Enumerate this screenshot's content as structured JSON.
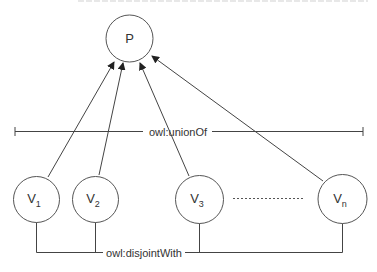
{
  "diagram": {
    "parent_node": {
      "label": "P"
    },
    "children": [
      {
        "base": "V",
        "sub": "1"
      },
      {
        "base": "V",
        "sub": "2"
      },
      {
        "base": "V",
        "sub": "3"
      },
      {
        "base": "V",
        "sub": "n"
      }
    ],
    "union_label": "owl:unionOf",
    "disjoint_label": "owl:disjointWith",
    "ellipsis_between": [
      "V3",
      "Vn"
    ]
  }
}
